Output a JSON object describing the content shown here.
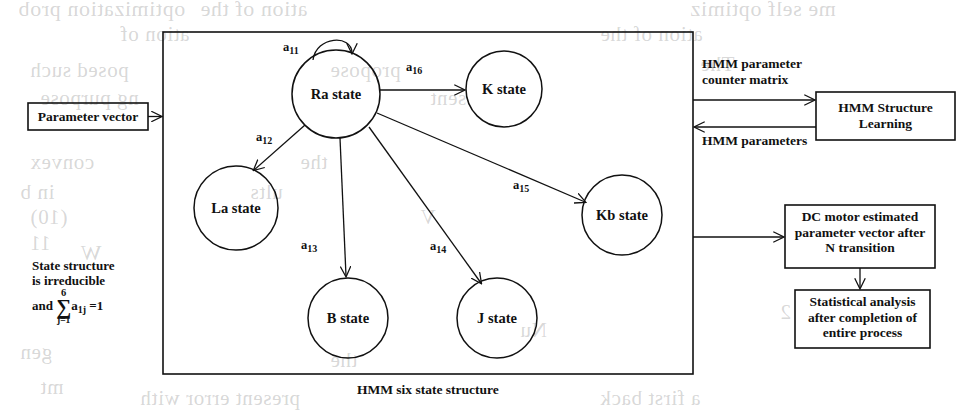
{
  "diagram": {
    "caption": "HMM six state structure",
    "note": {
      "line1": "State structure",
      "line2": "is irreducible",
      "and": "and",
      "sum_upper": "6",
      "sum_symbol": "∑",
      "sum_lower": "j=1",
      "term": "a",
      "term_sub": "1j",
      "equals": "=1"
    },
    "states": [
      {
        "id": "ra",
        "label": "Ra state",
        "cx": 336,
        "cy": 94,
        "r": 44
      },
      {
        "id": "k",
        "label": "K state",
        "cx": 504,
        "cy": 89,
        "r": 38
      },
      {
        "id": "la",
        "label": "La state",
        "cx": 236,
        "cy": 208,
        "r": 42
      },
      {
        "id": "kb",
        "label": "Kb state",
        "cx": 622,
        "cy": 215,
        "r": 40
      },
      {
        "id": "b",
        "label": "B state",
        "cx": 348,
        "cy": 318,
        "r": 40
      },
      {
        "id": "j",
        "label": "J state",
        "cx": 497,
        "cy": 318,
        "r": 40
      }
    ],
    "transitions": [
      {
        "id": "a11",
        "base": "a",
        "sub": "11",
        "x": 283,
        "y": 40
      },
      {
        "id": "a16",
        "base": "a",
        "sub": "16",
        "x": 406,
        "y": 60
      },
      {
        "id": "a12",
        "base": "a",
        "sub": "12",
        "x": 256,
        "y": 130
      },
      {
        "id": "a13",
        "base": "a",
        "sub": "13",
        "x": 301,
        "y": 238
      },
      {
        "id": "a14",
        "base": "a",
        "sub": "14",
        "x": 430,
        "y": 239
      },
      {
        "id": "a15",
        "base": "a",
        "sub": "15",
        "x": 513,
        "y": 178
      }
    ]
  },
  "boxes": {
    "parameter_vector": {
      "label": "Parameter vector"
    },
    "hmm_structure_learning": {
      "line1": "HMM Structure",
      "line2": "Learning"
    },
    "dc_motor": {
      "line1": "DC motor estimated",
      "line2": "parameter vector after",
      "line3": "N transition"
    },
    "statistical_analysis": {
      "line1": "Statistical analysis",
      "line2": "after completion of",
      "line3": "entire process"
    }
  },
  "flows": {
    "counter_matrix": {
      "line1": "HMM parameter",
      "line2": "counter matrix"
    },
    "hmm_parameters": {
      "label": "HMM parameters"
    }
  },
  "ghost_text": [
    {
      "text": "optimization prob",
      "x": 18,
      "y": -4,
      "size": 22
    },
    {
      "text": "ation of the",
      "x": 200,
      "y": -4,
      "size": 22
    },
    {
      "text": "me self optimiz",
      "x": 690,
      "y": -4,
      "size": 22
    },
    {
      "text": "ation of",
      "x": 120,
      "y": 22,
      "size": 21
    },
    {
      "text": "ation of the",
      "x": 600,
      "y": 22,
      "size": 21
    },
    {
      "text": "The",
      "x": 700,
      "y": 52,
      "size": 21
    },
    {
      "text": "posed such",
      "x": 30,
      "y": 58,
      "size": 21
    },
    {
      "text": "propose",
      "x": 330,
      "y": 58,
      "size": 21
    },
    {
      "text": "ng purpose",
      "x": 40,
      "y": 86,
      "size": 21
    },
    {
      "text": "sent",
      "x": 430,
      "y": 86,
      "size": 21
    },
    {
      "text": "convex",
      "x": 30,
      "y": 150,
      "size": 21
    },
    {
      "text": "the",
      "x": 300,
      "y": 150,
      "size": 21
    },
    {
      "text": "in b",
      "x": 20,
      "y": 180,
      "size": 21
    },
    {
      "text": "ults",
      "x": 250,
      "y": 180,
      "size": 21
    },
    {
      "text": "(10)",
      "x": 30,
      "y": 205,
      "size": 21
    },
    {
      "text": "V",
      "x": 420,
      "y": 205,
      "size": 21
    },
    {
      "text": "W",
      "x": 80,
      "y": 240,
      "size": 22
    },
    {
      "text": "11",
      "x": 30,
      "y": 232,
      "size": 20
    },
    {
      "text": "Nu",
      "x": 520,
      "y": 318,
      "size": 21
    },
    {
      "text": "2",
      "x": 780,
      "y": 300,
      "size": 21
    },
    {
      "text": "gen",
      "x": 20,
      "y": 340,
      "size": 21
    },
    {
      "text": "the",
      "x": 330,
      "y": 348,
      "size": 21
    },
    {
      "text": "mt",
      "x": 40,
      "y": 375,
      "size": 21
    },
    {
      "text": "present error with",
      "x": 140,
      "y": 386,
      "size": 21
    },
    {
      "text": "a first back",
      "x": 600,
      "y": 386,
      "size": 21
    }
  ]
}
